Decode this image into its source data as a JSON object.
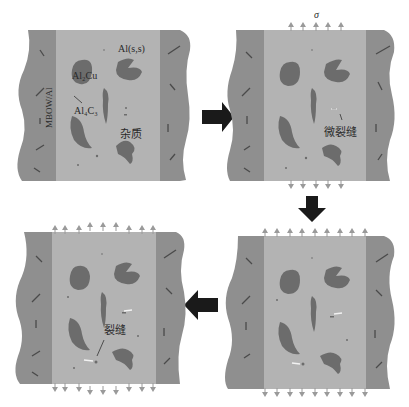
{
  "colors": {
    "background": "#ffffff",
    "composite_band": "#8f8f8f",
    "matrix": "#b3b3b3",
    "particle": "#6c6c6c",
    "fiber": "#4a4a4a",
    "flow_arrow": "#1a1a1a",
    "stress_arrow": "#9a9a9a",
    "crack": "#f2f2f2"
  },
  "panels": [
    {
      "id": "panel-1",
      "stage": "initial",
      "labels": {
        "matrix": "Al(s,s)",
        "al2cu": "Al₂Cu",
        "al4c3": "Al₄C₃",
        "impurity": "杂质",
        "composite": "MBOW/Al"
      }
    },
    {
      "id": "panel-2",
      "stage": "micro-crack",
      "labels": {
        "stress": "σ",
        "microcrack": "微裂缝"
      }
    },
    {
      "id": "panel-3",
      "stage": "crack-growth",
      "labels": {}
    },
    {
      "id": "panel-4",
      "stage": "crack",
      "labels": {
        "crack": "裂缝"
      }
    }
  ],
  "flow": {
    "arrow1": "right",
    "arrow2": "down",
    "arrow3": "left"
  }
}
